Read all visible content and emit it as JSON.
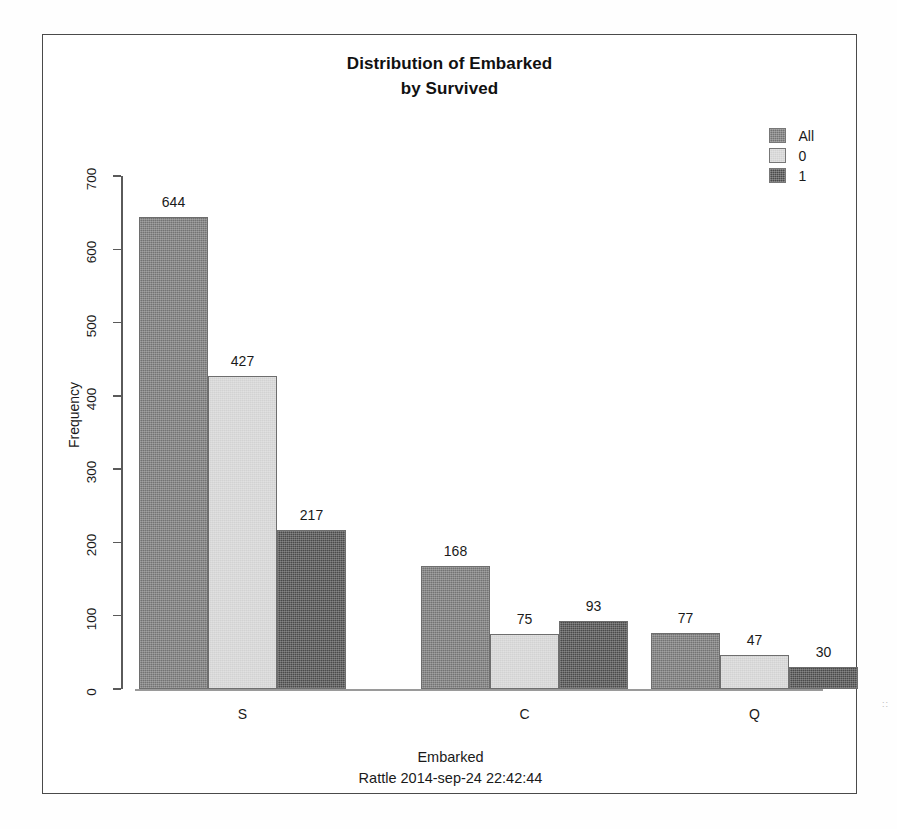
{
  "chart_data": {
    "type": "bar",
    "title": "Distribution of Embarked by Survived",
    "title_line1": "Distribution of Embarked",
    "title_line2": "by Survived",
    "xlabel": "Embarked",
    "ylabel": "Frequency",
    "footer": "Rattle 2014-sep-24 22:42:44",
    "categories": [
      "S",
      "C",
      "Q"
    ],
    "ylim": [
      0,
      700
    ],
    "yticks": [
      0,
      100,
      200,
      300,
      400,
      500,
      600,
      700
    ],
    "grid": false,
    "legend_position": "top-right",
    "series": [
      {
        "name": "All",
        "values": [
          644,
          168,
          77
        ],
        "color": "#737373"
      },
      {
        "name": "0",
        "values": [
          427,
          75,
          47
        ],
        "color": "#d2d2d2"
      },
      {
        "name": "1",
        "values": [
          217,
          93,
          30
        ],
        "color": "#4a4a4a"
      }
    ],
    "bar_labels": {
      "S": [
        "644",
        "427",
        "217"
      ],
      "C": [
        "168",
        "75",
        "93"
      ],
      "Q": [
        "77",
        "47",
        "30"
      ]
    }
  },
  "legend": {
    "items": [
      {
        "label": "All",
        "color": "#737373"
      },
      {
        "label": "0",
        "color": "#d2d2d2"
      },
      {
        "label": "1",
        "color": "#4a4a4a"
      }
    ]
  },
  "axis": {
    "y_tick_labels": [
      "0",
      "100",
      "200",
      "300",
      "400",
      "500",
      "600",
      "700"
    ],
    "x_tick_labels": [
      "S",
      "C",
      "Q"
    ]
  },
  "artifacts": {
    "mark": "::"
  }
}
